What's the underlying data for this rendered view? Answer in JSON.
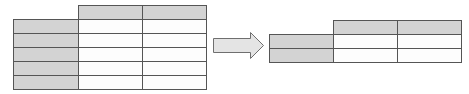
{
  "diagram": {
    "colors": {
      "header_fill": "#d3d3d3",
      "cell_fill": "#fdfdfd",
      "border": "#555555",
      "arrow_fill": "#e4e4e4",
      "arrow_stroke": "#6f6f6f"
    },
    "source_table": {
      "columns": 2,
      "rows": 5,
      "has_column_headers": true,
      "has_row_headers": true
    },
    "arrow": {
      "direction": "right"
    },
    "target_table": {
      "columns": 2,
      "rows": 2,
      "has_column_headers": true,
      "has_row_headers": true
    }
  }
}
